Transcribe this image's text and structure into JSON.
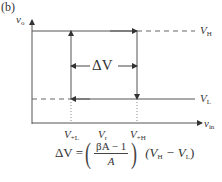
{
  "figure": {
    "panel_label": "(b)",
    "y_axis_label": "v",
    "y_axis_sub": "o",
    "x_axis_label": "v",
    "x_axis_sub": "in",
    "level_high": {
      "main": "V",
      "sub": "H"
    },
    "level_low": {
      "main": "V",
      "sub": "L"
    },
    "x_ticks": [
      {
        "main": "V",
        "sub": "+L"
      },
      {
        "main": "V",
        "sub": "r"
      },
      {
        "main": "V",
        "sub": "+H"
      }
    ],
    "hysteresis_width_label": "ΔV",
    "equation": {
      "lhs": "ΔV =",
      "numerator": "βA − 1",
      "denominator": "A",
      "rhs_open": "(V",
      "rhs_sub1": "H",
      "rhs_mid": " − V",
      "rhs_sub2": "L",
      "rhs_close": ")"
    }
  }
}
